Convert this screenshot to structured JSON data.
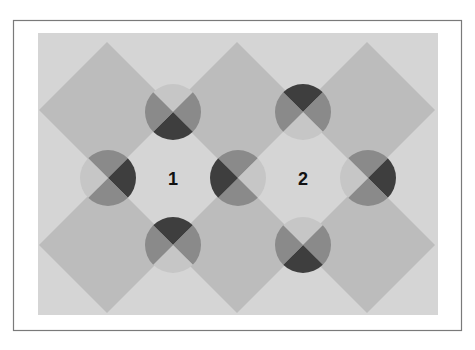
{
  "figure": {
    "width": 475,
    "height": 350,
    "frame": {
      "x": 13,
      "y": 20,
      "w": 448,
      "h": 310,
      "stroke": "#7a7a7a",
      "fill": "#ffffff"
    },
    "panel": {
      "x": 38,
      "y": 33,
      "w": 400,
      "h": 282,
      "fill": "#d5d5d5"
    },
    "colors": {
      "diamond": "#bcbcbc",
      "light": "#c6c6c6",
      "mid": "#8a8a8a",
      "dark": "#3e3e3e",
      "label": "#111111"
    },
    "diamonds": [
      {
        "id": "diamond-top-left",
        "cx": 107,
        "cy": 110,
        "r": 68
      },
      {
        "id": "diamond-top-center",
        "cx": 237,
        "cy": 110,
        "r": 68
      },
      {
        "id": "diamond-top-right",
        "cx": 367,
        "cy": 110,
        "r": 68
      },
      {
        "id": "diamond-bottom-left",
        "cx": 107,
        "cy": 245,
        "r": 68
      },
      {
        "id": "diamond-bottom-center",
        "cx": 237,
        "cy": 245,
        "r": 68
      },
      {
        "id": "diamond-bottom-right",
        "cx": 367,
        "cy": 245,
        "r": 68
      }
    ],
    "circles": [
      {
        "id": "circle-top-1",
        "cx": 173,
        "cy": 112,
        "r": 28,
        "top": "light",
        "right": "mid",
        "bottom": "dark",
        "left": "mid"
      },
      {
        "id": "circle-top-2",
        "cx": 303,
        "cy": 112,
        "r": 28,
        "top": "dark",
        "right": "mid",
        "bottom": "light",
        "left": "mid"
      },
      {
        "id": "circle-left",
        "cx": 108,
        "cy": 178,
        "r": 28,
        "top": "mid",
        "right": "dark",
        "bottom": "mid",
        "left": "light"
      },
      {
        "id": "circle-center",
        "cx": 238,
        "cy": 178,
        "r": 28,
        "top": "mid",
        "right": "light",
        "bottom": "mid",
        "left": "dark"
      },
      {
        "id": "circle-right",
        "cx": 368,
        "cy": 178,
        "r": 28,
        "top": "mid",
        "right": "dark",
        "bottom": "mid",
        "left": "light"
      },
      {
        "id": "circle-bottom-1",
        "cx": 173,
        "cy": 245,
        "r": 28,
        "top": "dark",
        "right": "mid",
        "bottom": "light",
        "left": "mid"
      },
      {
        "id": "circle-bottom-2",
        "cx": 303,
        "cy": 245,
        "r": 28,
        "top": "light",
        "right": "mid",
        "bottom": "dark",
        "left": "mid"
      }
    ],
    "labels": [
      {
        "id": "label-1",
        "text": "1",
        "x": 173,
        "y": 185
      },
      {
        "id": "label-2",
        "text": "2",
        "x": 303,
        "y": 185
      }
    ]
  }
}
